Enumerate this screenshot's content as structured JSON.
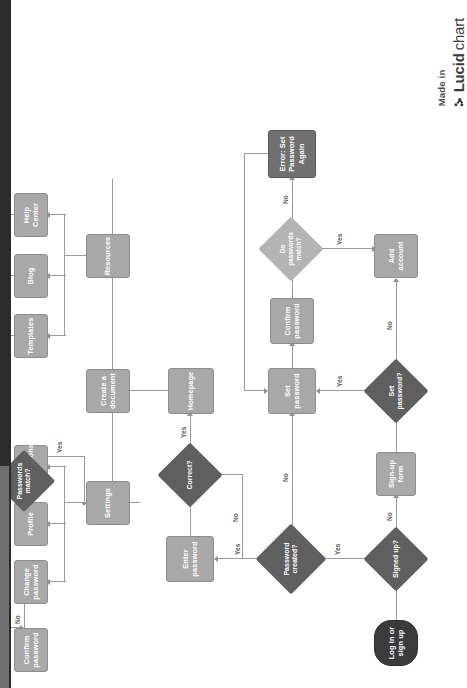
{
  "document": {
    "type": "flowchart",
    "orientation": "rotated-90-clockwise",
    "background_color": "#ffffff",
    "edge_strip_color": "#2b2b2b"
  },
  "watermark": {
    "made_in": "Made in",
    "brand_bold": "Lucid",
    "brand_light": "chart",
    "logo_icon": "lucidchart-logo-icon"
  },
  "palette": {
    "process_fill": "#a8a8a8",
    "process_dark_fill": "#707070",
    "decision_fill": "#5f5f5f",
    "decision_light_fill": "#b4b4b4",
    "terminator_fill": "#3b3b3b",
    "connector": "#9a9a9a",
    "node_text": "#ffffff",
    "edge_label_text": "#5c5c5c"
  },
  "nodes": [
    {
      "id": "start",
      "shape": "terminator",
      "label": "Log in or\nsign up"
    },
    {
      "id": "signed_up",
      "shape": "decision",
      "label": "Signed up?"
    },
    {
      "id": "signup_form",
      "shape": "process",
      "label": "Sign-up form"
    },
    {
      "id": "set_password_q",
      "shape": "decision",
      "label": "Set password?"
    },
    {
      "id": "add_account",
      "shape": "process",
      "label": "Add account"
    },
    {
      "id": "password_created",
      "shape": "decision",
      "label": "Password\ncreated?"
    },
    {
      "id": "set_password",
      "shape": "process",
      "label": "Set password"
    },
    {
      "id": "confirm_password",
      "shape": "process",
      "label": "Confirm\npassword"
    },
    {
      "id": "do_pw_match",
      "shape": "decision-light",
      "label": "Do\npasswords\nmatch?"
    },
    {
      "id": "error_set_again",
      "shape": "process-dark",
      "label": "Error: Set\nPassword Again"
    },
    {
      "id": "enter_password",
      "shape": "process",
      "label": "Enter password"
    },
    {
      "id": "correct",
      "shape": "decision",
      "label": "Correct?"
    },
    {
      "id": "homepage",
      "shape": "process",
      "label": "Homepage"
    },
    {
      "id": "settings",
      "shape": "process",
      "label": "Settings"
    },
    {
      "id": "create_document",
      "shape": "process",
      "label": "Create a\ndocument"
    },
    {
      "id": "resources",
      "shape": "process",
      "label": "Resources"
    },
    {
      "id": "change_password",
      "shape": "process",
      "label": "Change\npassword"
    },
    {
      "id": "profile",
      "shape": "process",
      "label": "Profile"
    },
    {
      "id": "notifications",
      "shape": "process",
      "label": "Notifications"
    },
    {
      "id": "confirm_password2",
      "shape": "process",
      "label": "Confirm\npassword"
    },
    {
      "id": "passwords_match",
      "shape": "decision",
      "label": "Passwords\nmatch?"
    },
    {
      "id": "templates",
      "shape": "process",
      "label": "Templates"
    },
    {
      "id": "blog",
      "shape": "process",
      "label": "Blog"
    },
    {
      "id": "help_center",
      "shape": "process",
      "label": "Help Center"
    }
  ],
  "node_labels": {
    "start_l1": "Log in or",
    "start_l2": "sign up",
    "signed_up": "Signed up?",
    "signup_form": "Sign-up form",
    "set_password_q": "Set password?",
    "add_account": "Add account",
    "password_created_l1": "Password",
    "password_created_l2": "created?",
    "set_password": "Set password",
    "confirm_password_l1": "Confirm",
    "confirm_password_l2": "password",
    "do_pw_match_l1": "Do",
    "do_pw_match_l2": "passwords",
    "do_pw_match_l3": "match?",
    "error_l1": "Error: Set",
    "error_l2": "Password Again",
    "enter_password": "Enter password",
    "correct": "Correct?",
    "homepage": "Homepage",
    "settings": "Settings",
    "create_document_l1": "Create a",
    "create_document_l2": "document",
    "resources": "Resources",
    "change_password_l1": "Change",
    "change_password_l2": "password",
    "profile": "Profile",
    "notifications": "Notifications",
    "confirm_password2_l1": "Confirm",
    "confirm_password2_l2": "password",
    "passwords_match_l1": "Passwords",
    "passwords_match_l2": "match?",
    "templates": "Templates",
    "blog": "Blog",
    "help_center": "Help Center"
  },
  "edge_labels": {
    "signed_up_yes": "Yes",
    "signed_up_no": "No",
    "set_password_q_yes": "Yes",
    "set_password_q_no": "No",
    "password_created_yes": "Yes",
    "password_created_no": "No",
    "do_pw_match_yes": "Yes",
    "do_pw_match_no": "No",
    "correct_yes": "Yes",
    "correct_no": "No",
    "passwords_match_yes": "Yes",
    "passwords_match_no": "No"
  },
  "edges": [
    {
      "from": "start",
      "to": "signed_up",
      "label": ""
    },
    {
      "from": "signed_up",
      "to": "signup_form",
      "label": "No"
    },
    {
      "from": "signed_up",
      "to": "password_created",
      "label": "Yes"
    },
    {
      "from": "signup_form",
      "to": "set_password_q",
      "label": ""
    },
    {
      "from": "set_password_q",
      "to": "set_password",
      "label": "Yes"
    },
    {
      "from": "set_password_q",
      "to": "add_account",
      "label": "No"
    },
    {
      "from": "password_created",
      "to": "enter_password",
      "label": "Yes"
    },
    {
      "from": "password_created",
      "to": "set_password",
      "label": "No"
    },
    {
      "from": "set_password",
      "to": "confirm_password",
      "label": ""
    },
    {
      "from": "confirm_password",
      "to": "do_pw_match",
      "label": ""
    },
    {
      "from": "do_pw_match",
      "to": "add_account",
      "label": "Yes"
    },
    {
      "from": "do_pw_match",
      "to": "error_set_again",
      "label": "No"
    },
    {
      "from": "error_set_again",
      "to": "set_password",
      "label": ""
    },
    {
      "from": "enter_password",
      "to": "correct",
      "label": ""
    },
    {
      "from": "correct",
      "to": "homepage",
      "label": "Yes"
    },
    {
      "from": "correct",
      "to": "enter_password",
      "label": "No"
    },
    {
      "from": "homepage",
      "to": "settings",
      "label": ""
    },
    {
      "from": "homepage",
      "to": "create_document",
      "label": ""
    },
    {
      "from": "homepage",
      "to": "resources",
      "label": ""
    },
    {
      "from": "settings",
      "to": "change_password",
      "label": ""
    },
    {
      "from": "settings",
      "to": "profile",
      "label": ""
    },
    {
      "from": "settings",
      "to": "notifications",
      "label": ""
    },
    {
      "from": "change_password",
      "to": "confirm_password2",
      "label": ""
    },
    {
      "from": "confirm_password2",
      "to": "passwords_match",
      "label": ""
    },
    {
      "from": "passwords_match",
      "to": "change_password",
      "label": "No"
    },
    {
      "from": "passwords_match",
      "to": "settings",
      "label": "Yes"
    },
    {
      "from": "resources",
      "to": "templates",
      "label": ""
    },
    {
      "from": "resources",
      "to": "blog",
      "label": ""
    },
    {
      "from": "resources",
      "to": "help_center",
      "label": ""
    }
  ]
}
